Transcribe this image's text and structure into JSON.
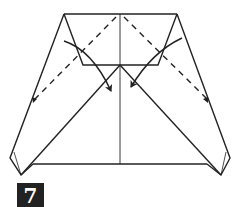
{
  "diagram": {
    "step_number": "7",
    "colors": {
      "line": "#222222",
      "background": "#ffffff",
      "badge_bg": "#222222",
      "badge_text": "#ffffff"
    },
    "elements": [
      "trapezoid outline",
      "inner flap folded down",
      "center crease",
      "two diagonal edges",
      "two dashed valley-fold lines",
      "two curved fold arrows"
    ]
  }
}
